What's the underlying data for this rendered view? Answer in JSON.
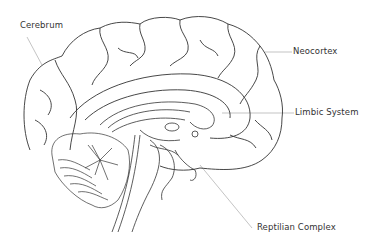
{
  "diagram": {
    "line_color": "#333333",
    "leader_color": "#aaaaaa",
    "labels": [
      {
        "id": "cerebrum",
        "text": "Cerebrum",
        "x": 20,
        "y": 25
      },
      {
        "id": "neocortex",
        "text": "Neocortex",
        "x": 293,
        "y": 46
      },
      {
        "id": "limbic",
        "text": "Limbic System",
        "x": 295,
        "y": 107
      },
      {
        "id": "reptilian",
        "text": "Reptilian Complex",
        "x": 257,
        "y": 226
      }
    ]
  }
}
